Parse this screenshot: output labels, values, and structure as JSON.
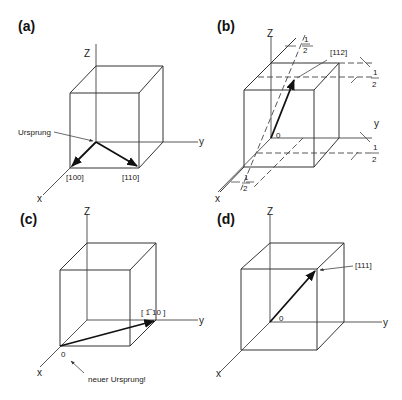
{
  "panels": [
    {
      "id": "a",
      "label": "(a)",
      "axis_labels": {
        "z": "Z",
        "y": "y",
        "x": "x"
      },
      "origin_label": "Ursprung",
      "vectors": [
        {
          "label": "[100]"
        },
        {
          "label": "[110]"
        }
      ]
    },
    {
      "id": "b",
      "label": "(b)",
      "axis_labels": {
        "z": "Z",
        "y": "y",
        "x": "x"
      },
      "origin_label": "0",
      "vectors": [
        {
          "label": "[112]"
        }
      ],
      "dimension_labels": {
        "num": "1",
        "den": "2"
      }
    },
    {
      "id": "c",
      "label": "(c)",
      "axis_labels": {
        "z": "Z",
        "y": "y",
        "x": "x"
      },
      "origin_label": "0",
      "new_origin_note": "neuer Ursprung!",
      "vectors": [
        {
          "label": "[ 1̅ 10 ]"
        }
      ]
    },
    {
      "id": "d",
      "label": "(d)",
      "axis_labels": {
        "z": "Z",
        "y": "y",
        "x": "x"
      },
      "origin_label": "0",
      "vectors": [
        {
          "label": "[111]"
        }
      ]
    }
  ]
}
